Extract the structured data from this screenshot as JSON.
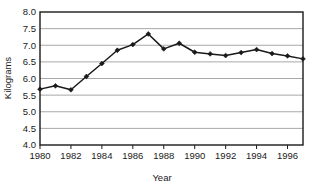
{
  "chart_data": {
    "type": "line",
    "title": "",
    "xlabel": "Year",
    "ylabel": "Kilograms",
    "xlim": [
      1980,
      1997
    ],
    "ylim": [
      4.0,
      8.0
    ],
    "grid": true,
    "legend": false,
    "marker": "diamond",
    "line_color": "#1a1a1a",
    "grid_color": "#a8a8a8",
    "axis_color": "#1a1a1a",
    "background": "#ffffff",
    "x": [
      1980,
      1981,
      1982,
      1983,
      1984,
      1985,
      1986,
      1987,
      1988,
      1989,
      1990,
      1991,
      1992,
      1993,
      1994,
      1995,
      1996,
      1997
    ],
    "values": [
      5.68,
      5.78,
      5.66,
      6.06,
      6.45,
      6.85,
      7.02,
      7.34,
      6.89,
      7.06,
      6.79,
      6.74,
      6.69,
      6.78,
      6.87,
      6.75,
      6.68,
      6.59
    ],
    "ytick_labels": [
      "8.0",
      "7.5",
      "7.0",
      "6.5",
      "6.0",
      "5.5",
      "5.0",
      "4.5",
      "4.0"
    ],
    "ytick_values": [
      8.0,
      7.5,
      7.0,
      6.5,
      6.0,
      5.5,
      5.0,
      4.5,
      4.0
    ],
    "xtick_labels": [
      "1980",
      "1982",
      "1984",
      "1986",
      "1988",
      "1990",
      "1992",
      "1994",
      "1996"
    ],
    "xtick_values": [
      1980,
      1982,
      1984,
      1986,
      1988,
      1990,
      1992,
      1994,
      1996
    ]
  }
}
